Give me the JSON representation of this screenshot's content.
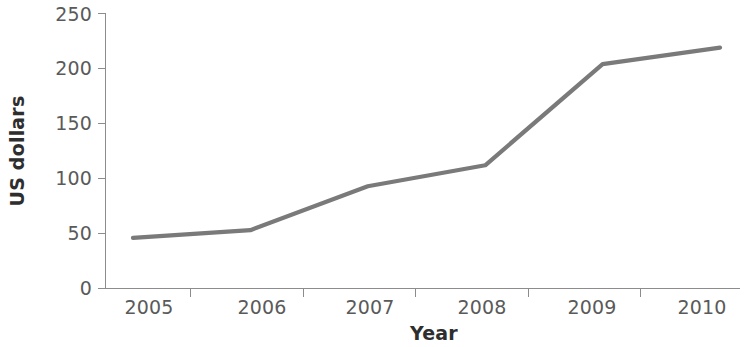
{
  "chart_data": {
    "type": "line",
    "title": "",
    "subtitle": "",
    "xlabel": "Year",
    "ylabel": "US dollars",
    "categories": [
      "2005",
      "2006",
      "2007",
      "2008",
      "2009",
      "2010"
    ],
    "x": [
      2005,
      2006,
      2007,
      2008,
      2009,
      2010
    ],
    "values": [
      46,
      53,
      93,
      112,
      204,
      219
    ],
    "series": [
      {
        "name": "US dollars",
        "values": [
          46,
          53,
          93,
          112,
          204,
          219
        ],
        "color": "#7a7a7a"
      }
    ],
    "ylim": [
      0,
      250
    ],
    "yticks": [
      0,
      50,
      100,
      150,
      200,
      250
    ],
    "ytick_labels": [
      "0",
      "50",
      "100",
      "150",
      "200",
      "250"
    ],
    "xtick_labels": [
      "2005",
      "2006",
      "2007",
      "2008",
      "2009",
      "2010"
    ],
    "grid": false,
    "legend": false,
    "legend_position": "none",
    "markers": false,
    "annotations": []
  },
  "axes": {
    "y_title": "US dollars",
    "x_title": "Year"
  },
  "colors": {
    "line": "#7a7a7a",
    "axis": "#8c8c8c",
    "tick_text": "#5a5a5a",
    "title_text": "#2e2e2e",
    "background": "#ffffff"
  }
}
